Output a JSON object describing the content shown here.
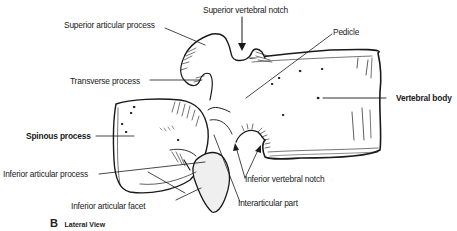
{
  "diagram": {
    "view_letter": "B",
    "view_title": "Lateral View",
    "labels": [
      {
        "id": "superior-vertebral-notch",
        "text": "Superior vertebral notch",
        "bold": false
      },
      {
        "id": "superior-articular-process",
        "text": "Superior articular process",
        "bold": false
      },
      {
        "id": "pedicle",
        "text": "Pedicle",
        "bold": false
      },
      {
        "id": "transverse-process",
        "text": "Transverse process",
        "bold": false
      },
      {
        "id": "vertebral-body",
        "text": "Vertebral body",
        "bold": true
      },
      {
        "id": "spinous-process",
        "text": "Spinous process",
        "bold": true
      },
      {
        "id": "inferior-articular-process",
        "text": "Inferior articular process",
        "bold": false
      },
      {
        "id": "inferior-vertebral-notch",
        "text": "Inferior vertebral notch",
        "bold": false
      },
      {
        "id": "inferior-articular-facet",
        "text": "Inferior articular facet",
        "bold": false
      },
      {
        "id": "interarticular-part",
        "text": "Interarticular part",
        "bold": false
      }
    ],
    "colors": {
      "line": "#1a1a1a",
      "bone_fill": "#ffffff",
      "facet_fill": "#efefef",
      "background": "#ffffff"
    }
  }
}
